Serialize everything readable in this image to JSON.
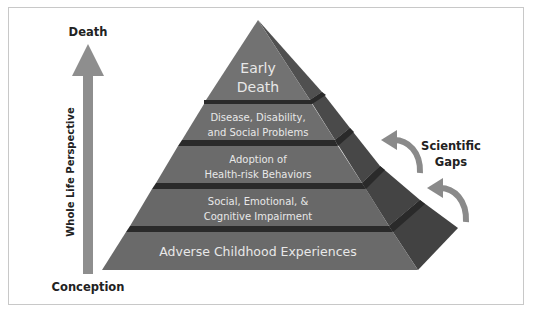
{
  "diagram": {
    "type": "pyramid",
    "axis": {
      "top_label": "Death",
      "bottom_label": "Conception",
      "side_label": "Whole Life Perspective"
    },
    "levels": [
      {
        "line1": "Early",
        "line2": "Death"
      },
      {
        "line1": "Disease, Disability,",
        "line2": "and Social Problems"
      },
      {
        "line1": "Adoption of",
        "line2": "Health-risk Behaviors"
      },
      {
        "line1": "Social, Emotional, &",
        "line2": "Cognitive Impairment"
      },
      {
        "line1": "Adverse Childhood Experiences"
      }
    ],
    "annotation": {
      "line1": "Scientific",
      "line2": "Gaps"
    },
    "colors": {
      "front_face": "#6e6e6e",
      "side_face": "#4a4a4a",
      "separator": "#2a2a2a",
      "arrow": "#8a8a8a",
      "text_on_pyramid": "#e8e8e8",
      "label_text": "#222222",
      "frame_border": "#c8c8c8"
    }
  }
}
